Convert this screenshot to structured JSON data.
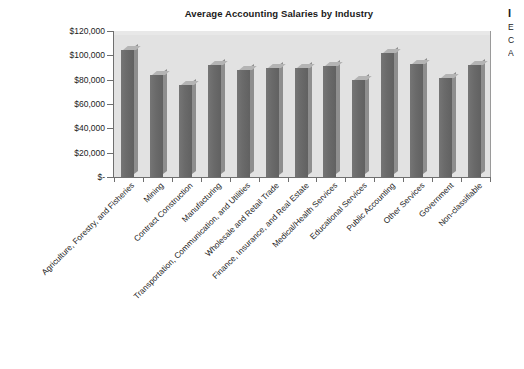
{
  "chart_data": {
    "type": "bar",
    "title": "Average Accounting Salaries by Industry",
    "xlabel": "",
    "ylabel": "",
    "ylim": [
      0,
      120000
    ],
    "ytick_labels": [
      "$120,000",
      "$100,000",
      "$80,000",
      "$60,000",
      "$40,000",
      "$20,000",
      "$-"
    ],
    "ytick_values": [
      120000,
      100000,
      80000,
      60000,
      40000,
      20000,
      0
    ],
    "grid": false,
    "legend": "none",
    "bar_style": "3d-column",
    "categories": [
      "Agriculture, Forestry, and Fisheries",
      "Mining",
      "Contract Construction",
      "Manufacturing",
      "Transportation, Communication, and Utilities",
      "Wholesale and Retail Trade",
      "Finance, Insurance, and Real Estate",
      "Medical/Health Services",
      "Educational Services",
      "Public Accounting",
      "Other Services",
      "Government",
      "Non-classifiable"
    ],
    "values": [
      104000,
      84000,
      76000,
      92000,
      88000,
      90000,
      90000,
      91000,
      80000,
      102000,
      93000,
      81000,
      92000
    ]
  },
  "colors": {
    "plot_background": "#e2e2e2",
    "bar_front": "#6a6a6a",
    "bar_top": "#b4b4b4",
    "bar_side": "#8e8e8e",
    "axis": "#6f6f6f",
    "text": "#1c1c1c",
    "page_background": "#ffffff"
  },
  "margin_text": {
    "heading_fragment": "I",
    "line_fragments": [
      "E",
      "C",
      "A"
    ]
  }
}
